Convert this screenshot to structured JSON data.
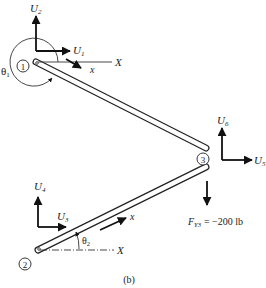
{
  "figure": {
    "caption": "(b)",
    "nodes": [
      {
        "id": "1",
        "label": "1"
      },
      {
        "id": "2",
        "label": "2"
      },
      {
        "id": "3",
        "label": "3"
      }
    ],
    "displacements": {
      "U1": {
        "main": "U",
        "sub": "1"
      },
      "U2": {
        "main": "U",
        "sub": "2"
      },
      "U3": {
        "main": "U",
        "sub": "3"
      },
      "U4": {
        "main": "U",
        "sub": "4"
      },
      "U5": {
        "main": "U",
        "sub": "5"
      },
      "U6": {
        "main": "U",
        "sub": "6"
      }
    },
    "axes": {
      "global_x_top": "X",
      "global_x_bottom": "X",
      "local_x_top": "x",
      "local_x_bottom": "x"
    },
    "angles": {
      "theta1": {
        "main": "θ",
        "sub": "1"
      },
      "theta2": {
        "main": "θ",
        "sub": "2"
      }
    },
    "load": {
      "main": "F",
      "sub": "Y3",
      "value": "= −200 lb"
    }
  }
}
